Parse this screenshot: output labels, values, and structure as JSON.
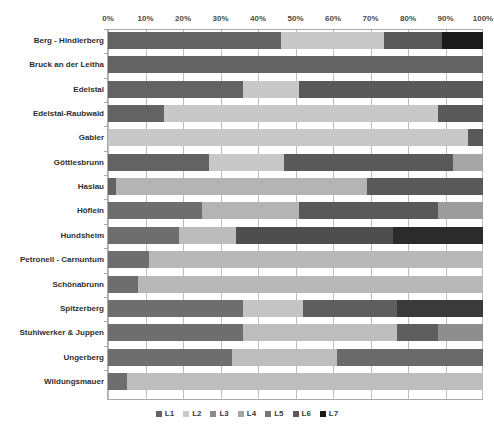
{
  "chart_data": {
    "type": "bar",
    "orientation": "horizontal",
    "stacked": true,
    "normalized": "100%",
    "title": "",
    "xlabel": "",
    "ylabel": "",
    "xlim": [
      0,
      100
    ],
    "grid": true,
    "legend_position": "bottom",
    "xticks": [
      "0%",
      "10%",
      "20%",
      "30%",
      "40%",
      "50%",
      "60%",
      "70%",
      "80%",
      "90%",
      "100%"
    ],
    "xtick_values": [
      0,
      10,
      20,
      30,
      40,
      50,
      60,
      70,
      80,
      90,
      100
    ],
    "categories": [
      "Berg - Hindlerberg",
      "Bruck an der Leitha",
      "Edelstal",
      "Edelstal-Raubwald",
      "Gabler",
      "Göttlesbrunn",
      "Haslau",
      "Höflein",
      "Hundsheim",
      "Petronell - Carnuntum",
      "Schönabrunn",
      "Spitzerberg",
      "Stuhlwerker & Juppen",
      "Ungerberg",
      "Wildungsmauer"
    ],
    "series": [
      {
        "name": "L1",
        "color": "#636363",
        "values": [
          46.0,
          100.0,
          36.0,
          15.0,
          0.0,
          27.0,
          2.0,
          25.0,
          19.0,
          11.0,
          8.0,
          36.0,
          36.0,
          33.0,
          5.0
        ]
      },
      {
        "name": "L2",
        "color": "#c8c8c8",
        "values": [
          27.5,
          0.0,
          15.0,
          73.0,
          96.0,
          20.0,
          67.0,
          26.0,
          15.0,
          89.0,
          92.0,
          16.0,
          41.0,
          28.0,
          95.0
        ]
      },
      {
        "name": "L3",
        "color": "#8c8c8c",
        "values": [
          0.0,
          0.0,
          0.0,
          0.0,
          0.0,
          0.0,
          0.0,
          0.0,
          0.0,
          0.0,
          0.0,
          0.0,
          0.0,
          0.0,
          0.0
        ]
      },
      {
        "name": "L4",
        "color": "#a6a6a6",
        "values": [
          0.0,
          0.0,
          0.0,
          0.0,
          0.0,
          0.0,
          0.0,
          0.0,
          0.0,
          0.0,
          0.0,
          0.0,
          0.0,
          0.0,
          0.0
        ]
      },
      {
        "name": "L5",
        "color": "#767676",
        "values": [
          0.0,
          0.0,
          0.0,
          0.0,
          0.0,
          0.0,
          0.0,
          0.0,
          0.0,
          0.0,
          0.0,
          0.0,
          0.0,
          0.0,
          0.0
        ]
      },
      {
        "name": "L6",
        "color": "#595959",
        "values": [
          15.5,
          0.0,
          49.0,
          12.0,
          4.0,
          45.0,
          31.0,
          37.0,
          42.0,
          0.0,
          0.0,
          25.0,
          11.0,
          39.0,
          0.0
        ]
      },
      {
        "name": "L7",
        "color": "#1a1a1a",
        "values": [
          11.0,
          0.0,
          0.0,
          0.0,
          0.0,
          0.0,
          0.0,
          0.0,
          24.0,
          0.0,
          0.0,
          23.0,
          0.0,
          0.0,
          0.0
        ]
      }
    ],
    "stacks": [
      {
        "category": "Berg - Hindlerberg",
        "segments": [
          {
            "series": "L1",
            "value": 46.0,
            "color": "#636363"
          },
          {
            "series": "L2",
            "value": 27.5,
            "color": "#c8c8c8"
          },
          {
            "series": "L6",
            "value": 15.5,
            "color": "#595959"
          },
          {
            "series": "L7",
            "value": 11.0,
            "color": "#1a1a1a"
          }
        ]
      },
      {
        "category": "Bruck an der Leitha",
        "segments": [
          {
            "series": "L1",
            "value": 100.0,
            "color": "#636363"
          }
        ]
      },
      {
        "category": "Edelstal",
        "segments": [
          {
            "series": "L1",
            "value": 36.0,
            "color": "#636363"
          },
          {
            "series": "L2",
            "value": 15.0,
            "color": "#c8c8c8"
          },
          {
            "series": "L6",
            "value": 49.0,
            "color": "#595959"
          }
        ]
      },
      {
        "category": "Edelstal-Raubwald",
        "segments": [
          {
            "series": "L1",
            "value": 15.0,
            "color": "#636363"
          },
          {
            "series": "L2",
            "value": 73.0,
            "color": "#c8c8c8"
          },
          {
            "series": "L6",
            "value": 12.0,
            "color": "#595959"
          }
        ]
      },
      {
        "category": "Gabler",
        "segments": [
          {
            "series": "L2",
            "value": 96.0,
            "color": "#c8c8c8"
          },
          {
            "series": "L6",
            "value": 4.0,
            "color": "#595959"
          }
        ]
      },
      {
        "category": "Göttlesbrunn",
        "segments": [
          {
            "series": "L1",
            "value": 27.0,
            "color": "#636363"
          },
          {
            "series": "L2",
            "value": 20.0,
            "color": "#c8c8c8"
          },
          {
            "series": "L6",
            "value": 45.0,
            "color": "#595959"
          },
          {
            "series": "L2",
            "value": 8.0,
            "color": "#a6a6a6"
          }
        ]
      },
      {
        "category": "Haslau",
        "segments": [
          {
            "series": "L1",
            "value": 2.0,
            "color": "#636363"
          },
          {
            "series": "L2",
            "value": 67.0,
            "color": "#b4b4b4"
          },
          {
            "series": "L6",
            "value": 31.0,
            "color": "#595959"
          }
        ]
      },
      {
        "category": "Höflein",
        "segments": [
          {
            "series": "L1",
            "value": 25.0,
            "color": "#6e6e6e"
          },
          {
            "series": "L2",
            "value": 26.0,
            "color": "#b4b4b4"
          },
          {
            "series": "L6",
            "value": 37.0,
            "color": "#595959"
          },
          {
            "series": "L4",
            "value": 12.0,
            "color": "#9c9c9c"
          }
        ]
      },
      {
        "category": "Hundsheim",
        "segments": [
          {
            "series": "L1",
            "value": 19.0,
            "color": "#6e6e6e"
          },
          {
            "series": "L2",
            "value": 15.0,
            "color": "#bcbcbc"
          },
          {
            "series": "L6",
            "value": 42.0,
            "color": "#4e4e4e"
          },
          {
            "series": "L7",
            "value": 24.0,
            "color": "#2b2b2b"
          }
        ]
      },
      {
        "category": "Petronell - Carnuntum",
        "segments": [
          {
            "series": "L1",
            "value": 11.0,
            "color": "#6e6e6e"
          },
          {
            "series": "L2",
            "value": 89.0,
            "color": "#b8b8b8"
          }
        ]
      },
      {
        "category": "Schönabrunn",
        "segments": [
          {
            "series": "L1",
            "value": 8.0,
            "color": "#6e6e6e"
          },
          {
            "series": "L2",
            "value": 92.0,
            "color": "#b8b8b8"
          }
        ]
      },
      {
        "category": "Spitzerberg",
        "segments": [
          {
            "series": "L1",
            "value": 36.0,
            "color": "#6e6e6e"
          },
          {
            "series": "L2",
            "value": 16.0,
            "color": "#c4c4c4"
          },
          {
            "series": "L6",
            "value": 25.0,
            "color": "#5e5e5e"
          },
          {
            "series": "L7",
            "value": 23.0,
            "color": "#3a3a3a"
          }
        ]
      },
      {
        "category": "Stuhlwerker & Juppen",
        "segments": [
          {
            "series": "L1",
            "value": 36.0,
            "color": "#6e6e6e"
          },
          {
            "series": "L2",
            "value": 41.0,
            "color": "#bdbdbd"
          },
          {
            "series": "L6",
            "value": 11.0,
            "color": "#5e5e5e"
          },
          {
            "series": "L4",
            "value": 12.0,
            "color": "#8e8e8e"
          }
        ]
      },
      {
        "category": "Ungerberg",
        "segments": [
          {
            "series": "L1",
            "value": 33.0,
            "color": "#6e6e6e"
          },
          {
            "series": "L2",
            "value": 28.0,
            "color": "#bdbdbd"
          },
          {
            "series": "L6",
            "value": 39.0,
            "color": "#6a6a6a"
          }
        ]
      },
      {
        "category": "Wildungsmauer",
        "segments": [
          {
            "series": "L1",
            "value": 5.0,
            "color": "#6e6e6e"
          },
          {
            "series": "L2",
            "value": 95.0,
            "color": "#bdbdbd"
          }
        ]
      }
    ]
  },
  "legend": {
    "items": [
      {
        "label": "L1",
        "color": "#636363"
      },
      {
        "label": "L2",
        "color": "#c8c8c8"
      },
      {
        "label": "L3",
        "color": "#8c8c8c"
      },
      {
        "label": "L4",
        "color": "#a6a6a6"
      },
      {
        "label": "L5",
        "color": "#767676"
      },
      {
        "label": "L6",
        "color": "#595959"
      },
      {
        "label": "L7",
        "color": "#1a1a1a"
      }
    ]
  }
}
